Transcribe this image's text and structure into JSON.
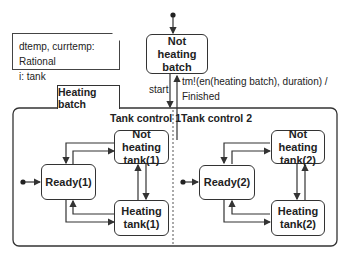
{
  "note": {
    "line1": "dtemp, currtemp: Rational",
    "line2": "i: tank"
  },
  "top_state": {
    "line1": "Not heating",
    "line2": "batch"
  },
  "composite": {
    "tab_label": "Heating batch",
    "regions": [
      {
        "title": "Tank control 1",
        "states": {
          "ready": "Ready(1)",
          "not_heating": [
            "Not heating",
            "tank(1)"
          ],
          "heating": [
            "Heating",
            "tank(1)"
          ]
        }
      },
      {
        "title": "Tank control 2",
        "states": {
          "ready": "Ready(2)",
          "not_heating": [
            "Not heating",
            "tank(2)"
          ],
          "heating": [
            "Heating",
            "tank(2)"
          ]
        }
      }
    ]
  },
  "transitions": {
    "start": "start",
    "finish_line1": "tm!(en(heating batch), duration) /",
    "finish_line2": "Finished"
  },
  "colors": {
    "line": "#333333",
    "background": "#ffffff"
  }
}
